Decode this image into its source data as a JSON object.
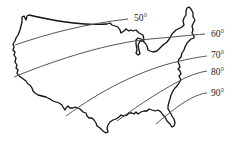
{
  "figure": {
    "type": "isotherm-map",
    "isotherms": [
      {
        "label": "50°",
        "value": 50
      },
      {
        "label": "60°",
        "value": 60
      },
      {
        "label": "70°",
        "value": 70
      },
      {
        "label": "80°",
        "value": 80
      },
      {
        "label": "90°",
        "value": 90
      }
    ],
    "colors": {
      "outline": "#111111",
      "isotherm": "#555555",
      "label": "#222222",
      "background": "#ffffff"
    }
  }
}
